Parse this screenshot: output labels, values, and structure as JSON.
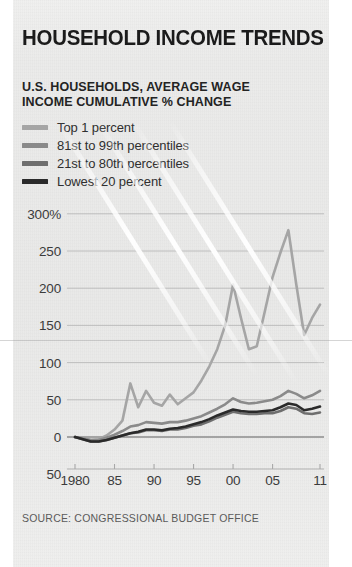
{
  "title": "HOUSEHOLD INCOME TRENDS",
  "subtitle_line1": "U.S. HOUSEHOLDS, AVERAGE WAGE",
  "subtitle_line2": "INCOME CUMULATIVE % CHANGE",
  "source": "SOURCE: CONGRESSIONAL BUDGET OFFICE",
  "legend": [
    {
      "label": "Top 1 percent",
      "color": "#a5a5a5"
    },
    {
      "label": "81st to 99th percentiles",
      "color": "#8a8a8a"
    },
    {
      "label": "21st to 80th percentiles",
      "color": "#6e6e6e"
    },
    {
      "label": "Lowest 20 percent",
      "color": "#2a2a2a"
    }
  ],
  "chart_data": {
    "type": "line",
    "title": "HOUSEHOLD INCOME TRENDS",
    "subtitle": "U.S. HOUSEHOLDS, AVERAGE WAGE INCOME CUMULATIVE % CHANGE",
    "xlabel": "",
    "ylabel": "Cumulative % change",
    "ylim": [
      -50,
      300
    ],
    "yticks": [
      -50,
      0,
      50,
      100,
      150,
      200,
      250,
      300
    ],
    "ytick_labels": [
      "50",
      "0",
      "50",
      "100",
      "150",
      "200",
      "250",
      "300%"
    ],
    "xlim": [
      1980,
      2011
    ],
    "xticks": [
      1980,
      1985,
      1990,
      1995,
      2000,
      2005,
      2011
    ],
    "xtick_labels": [
      "1980",
      "85",
      "90",
      "95",
      "00",
      "05",
      "11"
    ],
    "grid": true,
    "legend_position": "above-plot",
    "x": [
      1980,
      1981,
      1982,
      1983,
      1984,
      1985,
      1986,
      1987,
      1988,
      1989,
      1990,
      1991,
      1992,
      1993,
      1994,
      1995,
      1996,
      1997,
      1998,
      1999,
      2000,
      2001,
      2002,
      2003,
      2004,
      2005,
      2006,
      2007,
      2008,
      2009,
      2010,
      2011
    ],
    "series": [
      {
        "name": "Top 1 percent",
        "color": "#a5a5a5",
        "values": [
          0,
          -2,
          -4,
          -3,
          2,
          10,
          22,
          72,
          40,
          62,
          46,
          42,
          57,
          44,
          52,
          60,
          76,
          95,
          118,
          150,
          205,
          160,
          118,
          122,
          168,
          215,
          248,
          278,
          205,
          137,
          160,
          178
        ]
      },
      {
        "name": "81st to 99th percentiles",
        "color": "#8a8a8a",
        "values": [
          0,
          -2,
          -4,
          -4,
          -1,
          3,
          8,
          14,
          16,
          20,
          19,
          18,
          20,
          20,
          22,
          25,
          28,
          33,
          38,
          44,
          52,
          47,
          45,
          46,
          48,
          50,
          55,
          62,
          58,
          52,
          56,
          62
        ]
      },
      {
        "name": "21st to 80th percentiles",
        "color": "#6e6e6e",
        "values": [
          0,
          -3,
          -6,
          -6,
          -4,
          -1,
          2,
          5,
          6,
          9,
          9,
          8,
          10,
          10,
          12,
          15,
          17,
          21,
          26,
          30,
          34,
          32,
          31,
          31,
          32,
          32,
          35,
          40,
          38,
          32,
          31,
          33
        ]
      },
      {
        "name": "Lowest 20 percent",
        "color": "#2a2a2a",
        "values": [
          0,
          -3,
          -6,
          -6,
          -4,
          -1,
          2,
          5,
          7,
          10,
          10,
          9,
          11,
          12,
          14,
          17,
          20,
          24,
          29,
          33,
          37,
          35,
          34,
          34,
          35,
          36,
          40,
          45,
          43,
          36,
          38,
          41
        ]
      }
    ]
  },
  "plot_geometry": {
    "left_px": 75,
    "right_px": 320,
    "zero_y_px": 437,
    "px_per_50_units": 37.2,
    "axis_bottom_px": 469
  },
  "glare_streaks": [
    {
      "left": 60,
      "top": 120,
      "length": 290,
      "angle": 58,
      "width": 5
    },
    {
      "left": 100,
      "top": 120,
      "length": 300,
      "angle": 58,
      "width": 5
    },
    {
      "left": 135,
      "top": 120,
      "length": 310,
      "angle": 58,
      "width": 5
    },
    {
      "left": 172,
      "top": 120,
      "length": 300,
      "angle": 58,
      "width": 5
    }
  ]
}
